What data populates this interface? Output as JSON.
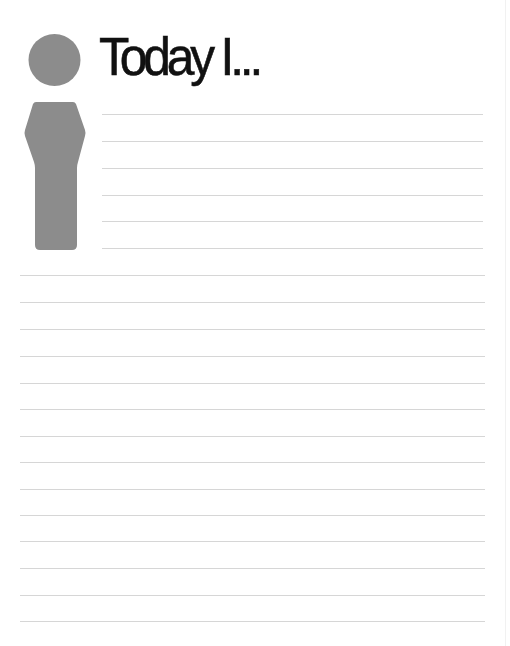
{
  "page": {
    "title": "Today I...",
    "background_color": "#ffffff",
    "text_color": "#111111",
    "figure_color": "#8c8c8c",
    "rule_color": "#d6d6d6"
  },
  "figure": {
    "icon": "person-info-icon"
  },
  "writing_area": {
    "short_rules_count": 6,
    "full_rules_count": 14,
    "short_rules_y": [
      114,
      141,
      168,
      195,
      221,
      248
    ],
    "full_rules_y": [
      275,
      302,
      329,
      356,
      383,
      409,
      436,
      462,
      489,
      515,
      541,
      568,
      595,
      621
    ]
  }
}
